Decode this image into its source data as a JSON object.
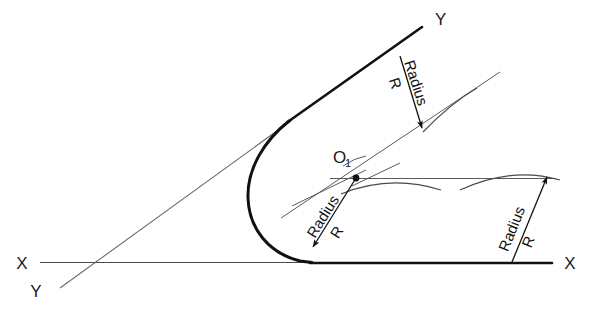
{
  "diagram": {
    "type": "technical-drawing",
    "colors": {
      "ink": "#1a1a1a",
      "thin_line": "#555555",
      "background": "#ffffff"
    },
    "axis_labels": {
      "x_left": "X",
      "x_right": "X",
      "y_top": "Y",
      "y_bottom": "Y"
    },
    "center_point": {
      "label": "O",
      "subscript": "1"
    },
    "dimensions": [
      {
        "id": "radius-upper-right",
        "label": "Radius",
        "value": "R"
      },
      {
        "id": "radius-center-left",
        "label": "Radius",
        "value": "R"
      },
      {
        "id": "radius-lower-right",
        "label": "Radius",
        "value": "R"
      }
    ]
  }
}
